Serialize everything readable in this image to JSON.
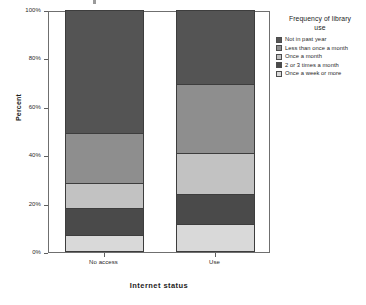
{
  "chart_data": {
    "type": "bar",
    "subtype": "100% stacked bar",
    "title": "",
    "xlabel": "Internet status",
    "ylabel": "Percent",
    "categories": [
      "No access",
      "Use"
    ],
    "ylim": [
      0,
      100
    ],
    "y_ticks": [
      "0%",
      "20%",
      "40%",
      "60%",
      "80%",
      "100%"
    ],
    "y_tick_values": [
      0,
      20,
      40,
      60,
      80,
      100
    ],
    "grid": false,
    "legend_position": "right",
    "legend_title": "Frequency of library use",
    "series": [
      {
        "name": "Once a week or more",
        "color": "#d9d9d9",
        "values": [
          7.0,
          11.5
        ]
      },
      {
        "name": "2 or 3 times a month",
        "color": "#4a4a4a",
        "values": [
          11.0,
          12.5
        ]
      },
      {
        "name": "Once a month",
        "color": "#c2c2c2",
        "values": [
          10.5,
          17.0
        ]
      },
      {
        "name": "Less than once a month",
        "color": "#8e8e8e",
        "values": [
          20.5,
          28.5
        ]
      },
      {
        "name": "Not in past year",
        "color": "#545454",
        "values": [
          51.0,
          30.5
        ]
      }
    ],
    "cumulative_boundaries": {
      "No access": [
        7.0,
        18.0,
        28.5,
        49.0,
        100.0
      ],
      "Use": [
        11.5,
        24.0,
        41.0,
        69.5,
        100.0
      ]
    }
  },
  "legend": {
    "title_line_1": "Frequency of library",
    "title_line_2": "use",
    "entries": [
      {
        "label": "Not in past year",
        "color": "#545454",
        "swatch_name": "legend-swatch-not-in-past-year"
      },
      {
        "label": "Less than once a month",
        "color": "#8e8e8e",
        "swatch_name": "legend-swatch-less-than-once-a-month"
      },
      {
        "label": "Once a month",
        "color": "#c2c2c2",
        "swatch_name": "legend-swatch-once-a-month"
      },
      {
        "label": "2 or 3 times a month",
        "color": "#4a4a4a",
        "swatch_name": "legend-swatch-2-or-3-times-a-month"
      },
      {
        "label": "Once a week or more",
        "color": "#d9d9d9",
        "swatch_name": "legend-swatch-once-a-week-or-more"
      }
    ]
  },
  "axes": {
    "y_title": "Percent",
    "x_title": "Internet status",
    "y_tick_labels": [
      "100%",
      "80%",
      "60%",
      "40%",
      "20%",
      "0%"
    ],
    "x_tick_labels": [
      "No access",
      "Use"
    ]
  },
  "colors": {
    "frame": "#6f6f6f",
    "segment_border": "#3d3d3d",
    "text": "#1c1c1c",
    "background": "#ffffff"
  }
}
